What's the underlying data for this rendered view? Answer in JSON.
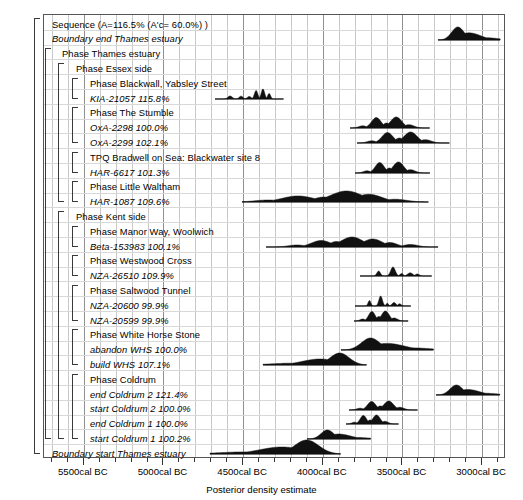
{
  "chart_data": {
    "type": "area",
    "title": "",
    "xlabel": "Posterior density estimate",
    "ylabel": "",
    "xlim": [
      5750,
      2850
    ],
    "grid": true,
    "legend": "none",
    "tick_labels": [
      "5500cal BC",
      "5000cal BC",
      "4500cal BC",
      "4000cal BC",
      "3500cal BC",
      "3000cal BC"
    ],
    "tick_values": [
      5500,
      5000,
      4500,
      4000,
      3500,
      3000
    ],
    "rows": [
      {
        "label": "Sequence",
        "stat": "(A=116.5% (A'c= 60.0%) )",
        "style": "plain",
        "indent": 0,
        "kind": "sequence",
        "dist": null
      },
      {
        "label": "Boundary end Thames estuary",
        "stat": "",
        "style": "italic",
        "indent": 0,
        "kind": "boundary",
        "dist": {
          "start": 3270,
          "end": 2880,
          "peak": 3130,
          "peak_h": 13,
          "shape": "skew-right"
        }
      },
      {
        "label": "Phase Thames estuary",
        "stat": "",
        "style": "plain",
        "indent": 1,
        "kind": "phase",
        "dist": null
      },
      {
        "label": "Phase Essex side",
        "stat": "",
        "style": "plain",
        "indent": 2,
        "kind": "phase",
        "dist": null
      },
      {
        "label": "Phase Blackwall, Yabsley Street",
        "stat": "",
        "style": "plain",
        "indent": 3,
        "kind": "phase",
        "dist": null
      },
      {
        "label": "KIA-21057",
        "stat": "115.8%",
        "style": "italic",
        "indent": 3,
        "kind": "date",
        "dist": {
          "start": 4670,
          "end": 4240,
          "peak": 4300,
          "peak_h": 10,
          "shape": "multi-small"
        }
      },
      {
        "label": "Phase The Stumble",
        "stat": "",
        "style": "plain",
        "indent": 3,
        "kind": "phase",
        "dist": null
      },
      {
        "label": "OxA-2298",
        "stat": "100.0%",
        "style": "italic",
        "indent": 3,
        "kind": "date",
        "dist": {
          "start": 3820,
          "end": 3320,
          "peak": 3650,
          "peak_h": 11,
          "shape": "twin"
        }
      },
      {
        "label": "OxA-2299",
        "stat": "102.1%",
        "style": "italic",
        "indent": 3,
        "kind": "date",
        "dist": {
          "start": 3780,
          "end": 3200,
          "peak": 3570,
          "peak_h": 11,
          "shape": "twin"
        }
      },
      {
        "label": "TPQ Bradwell on Sea: Blackwater site 8",
        "stat": "",
        "style": "plain",
        "indent": 3,
        "kind": "phase",
        "dist": null
      },
      {
        "label": "HAR-6617",
        "stat": "101.3%",
        "style": "italic",
        "indent": 3,
        "kind": "date",
        "dist": {
          "start": 3790,
          "end": 3320,
          "peak": 3630,
          "peak_h": 11,
          "shape": "twin"
        }
      },
      {
        "label": "Phase Little Waltham",
        "stat": "",
        "style": "plain",
        "indent": 3,
        "kind": "phase",
        "dist": null
      },
      {
        "label": "HAR-1087",
        "stat": "109.6%",
        "style": "italic",
        "indent": 3,
        "kind": "date",
        "dist": {
          "start": 4500,
          "end": 3330,
          "peak": 3950,
          "peak_h": 11,
          "shape": "broad"
        }
      },
      {
        "label": "Phase Kent side",
        "stat": "",
        "style": "plain",
        "indent": 2,
        "kind": "phase",
        "dist": null
      },
      {
        "label": "Phase Manor Way, Woolwich",
        "stat": "",
        "style": "plain",
        "indent": 3,
        "kind": "phase",
        "dist": null
      },
      {
        "label": "Beta-153983",
        "stat": "100.1%",
        "style": "italic",
        "indent": 3,
        "kind": "date",
        "dist": {
          "start": 4350,
          "end": 3270,
          "peak": 3900,
          "peak_h": 10,
          "shape": "broad-lumpy"
        }
      },
      {
        "label": "Phase Westwood Cross",
        "stat": "",
        "style": "plain",
        "indent": 3,
        "kind": "phase",
        "dist": null
      },
      {
        "label": "NZA-26510",
        "stat": "109.9%",
        "style": "italic",
        "indent": 3,
        "kind": "date",
        "dist": {
          "start": 3760,
          "end": 3310,
          "peak": 3570,
          "peak_h": 9,
          "shape": "spiky"
        }
      },
      {
        "label": "Phase Saltwood Tunnel",
        "stat": "",
        "style": "plain",
        "indent": 3,
        "kind": "phase",
        "dist": null
      },
      {
        "label": "NZA-20600",
        "stat": "99.9%",
        "style": "italic",
        "indent": 3,
        "kind": "date",
        "dist": {
          "start": 3790,
          "end": 3440,
          "peak": 3690,
          "peak_h": 10,
          "shape": "spiky"
        }
      },
      {
        "label": "NZA-20599",
        "stat": "99.9%",
        "style": "italic",
        "indent": 3,
        "kind": "date",
        "dist": {
          "start": 3800,
          "end": 3460,
          "peak": 3700,
          "peak_h": 10,
          "shape": "twin"
        }
      },
      {
        "label": "Phase White Horse Stone",
        "stat": "",
        "style": "plain",
        "indent": 3,
        "kind": "phase",
        "dist": null
      },
      {
        "label": "abandon WHS",
        "stat": "100.0%",
        "style": "italic",
        "indent": 3,
        "kind": "date",
        "dist": {
          "start": 3880,
          "end": 3300,
          "peak": 3680,
          "peak_h": 12,
          "shape": "skew-right"
        }
      },
      {
        "label": "build WHS",
        "stat": "107.1%",
        "style": "italic",
        "indent": 3,
        "kind": "date",
        "dist": {
          "start": 4370,
          "end": 3720,
          "peak": 4000,
          "peak_h": 12,
          "shape": "skew-left"
        }
      },
      {
        "label": "Phase Coldrum",
        "stat": "",
        "style": "plain",
        "indent": 3,
        "kind": "phase",
        "dist": null
      },
      {
        "label": "end Coldrum 2",
        "stat": "121.4%",
        "style": "italic",
        "indent": 3,
        "kind": "date",
        "dist": {
          "start": 3280,
          "end": 2880,
          "peak": 3130,
          "peak_h": 10,
          "shape": "skew-right"
        }
      },
      {
        "label": "start Coldrum 2",
        "stat": "100.0%",
        "style": "italic",
        "indent": 3,
        "kind": "date",
        "dist": {
          "start": 3830,
          "end": 3400,
          "peak": 3600,
          "peak_h": 9,
          "shape": "twin"
        }
      },
      {
        "label": "end Coldrum 1",
        "stat": "100.0%",
        "style": "italic",
        "indent": 3,
        "kind": "date",
        "dist": {
          "start": 3850,
          "end": 3520,
          "peak": 3760,
          "peak_h": 9,
          "shape": "twin"
        }
      },
      {
        "label": "start Coldrum 1",
        "stat": "100.2%",
        "style": "italic",
        "indent": 3,
        "kind": "date",
        "dist": {
          "start": 4090,
          "end": 3690,
          "peak": 3900,
          "peak_h": 9,
          "shape": "skew-right"
        }
      },
      {
        "label": "Boundary start Thames estuary",
        "stat": "",
        "style": "italic",
        "indent": 0,
        "kind": "boundary",
        "dist": {
          "start": 4700,
          "end": 3880,
          "peak": 3960,
          "peak_h": 14,
          "shape": "skew-left"
        }
      }
    ]
  },
  "axis": {
    "title": "Posterior density estimate",
    "ticks": [
      "5500cal BC",
      "5000cal BC",
      "4500cal BC",
      "4000cal BC",
      "3500cal BC",
      "3000cal BC"
    ]
  }
}
